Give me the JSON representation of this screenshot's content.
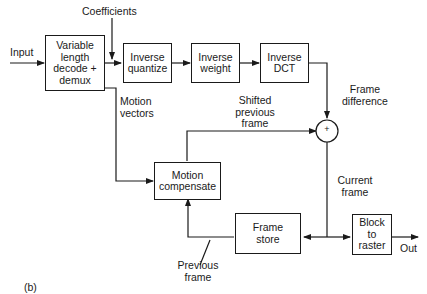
{
  "diagram": {
    "caption": "(b)",
    "blocks": {
      "vld": "Variable\nlength\ndecode +\ndemux",
      "iq": "Inverse\nquantize",
      "iw": "Inverse\nweight",
      "idct": "Inverse\nDCT",
      "mc": "Motion\ncompensate",
      "fs": "Frame\nstore",
      "b2r": "Block\nto\nraster"
    },
    "adder_symbol": "+",
    "labels": {
      "input": "Input",
      "coefficients": "Coefficients",
      "motion_vectors": "Motion\nvectors",
      "frame_difference": "Frame\ndifference",
      "shifted_previous_frame": "Shifted\nprevious\nframe",
      "current_frame": "Current\nframe",
      "previous_frame": "Previous\nframe",
      "out": "Out"
    },
    "colors": {
      "line": "#1a1a1a",
      "background": "#ffffff"
    }
  }
}
